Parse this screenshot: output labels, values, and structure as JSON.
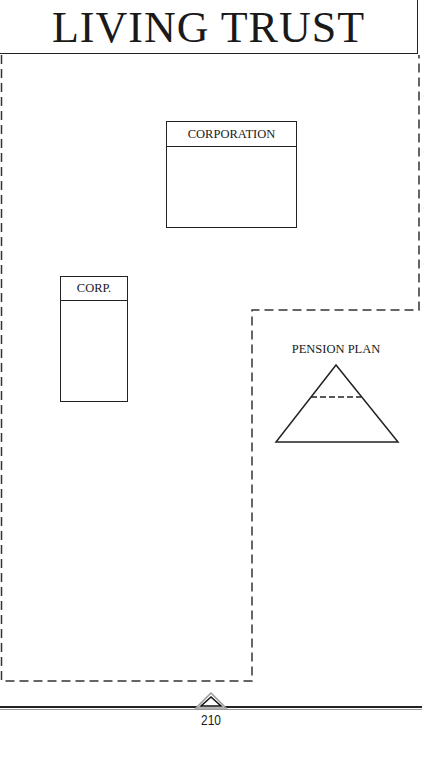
{
  "header": {
    "title": "LIVING TRUST"
  },
  "diagram": {
    "container": {
      "label": "living-trust-boundary",
      "style": "dashed"
    },
    "entities": [
      {
        "type": "box",
        "label": "CORPORATION"
      },
      {
        "type": "box",
        "label": "CORP."
      },
      {
        "type": "triangle",
        "label": "PENSION PLAN"
      }
    ]
  },
  "footer": {
    "page_number": "210"
  }
}
